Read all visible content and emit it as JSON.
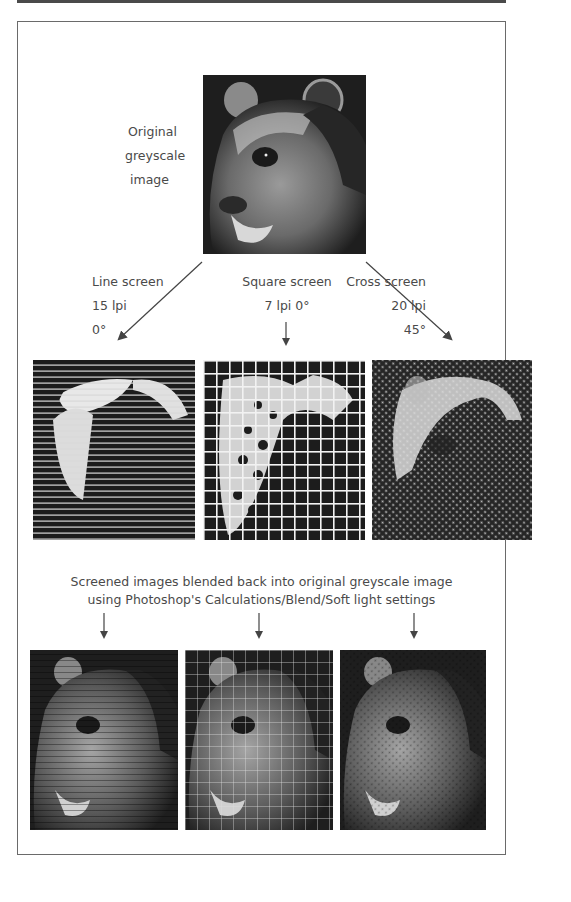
{
  "figure": {
    "original": {
      "label_lines": [
        "Original",
        "greyscale",
        "image"
      ],
      "image_alt": "Bear head greyscale photograph"
    },
    "screens": [
      {
        "name": "Line screen",
        "lpi": "15 lpi",
        "angle": "0°",
        "image_alt": "Bear with horizontal line screen"
      },
      {
        "name": "Square screen",
        "lpi_angle": "7 lpi  0°",
        "image_alt": "Bear with square grid screen"
      },
      {
        "name": "Cross screen",
        "lpi": "20 lpi",
        "angle": "45°",
        "image_alt": "Bear with diagonal cross screen"
      }
    ],
    "blend_caption": {
      "line1": "Screened images blended back into original greyscale image",
      "line2": "using Photoshop's Calculations/Blend/Soft light settings"
    },
    "blended": [
      {
        "image_alt": "Original blended with line screen"
      },
      {
        "image_alt": "Original blended with square screen"
      },
      {
        "image_alt": "Original blended with cross screen"
      }
    ]
  },
  "colors": {
    "frame": "#6a6a6a",
    "text": "#4a4a4a",
    "image_dark": "#1e1e1e"
  }
}
